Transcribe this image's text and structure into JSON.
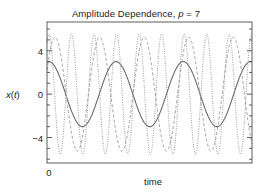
{
  "chart_data": {
    "type": "line",
    "title_parts": {
      "prefix": "Amplitude Dependence, ",
      "param_symbol": "p",
      "param_rest": " = 7"
    },
    "title": "Amplitude Dependence, p = 7",
    "xlabel": "time",
    "ylabel": "x(t)",
    "ylabel_parts": {
      "fn": "x",
      "open": "(",
      "var": "t",
      "close": ")"
    },
    "ylim": [
      -6.35,
      6.65
    ],
    "xlim": [
      0,
      18.5
    ],
    "yticks": [
      4,
      0,
      -4
    ],
    "ytick_labels": [
      "4",
      "0",
      "−4"
    ],
    "yticks_minor": [
      5,
      3,
      2,
      1,
      -1,
      -2,
      -3,
      -5,
      6,
      -6
    ],
    "xticks": [
      0
    ],
    "xtick_labels": [
      "0"
    ],
    "grid": false,
    "legend": "none",
    "frame": true,
    "tick_direction": "in",
    "colors": {
      "axis": "#4d4d4d",
      "text": "#1a1a1a",
      "curve_solid": "#6b6b6b",
      "curve_dotted": "#8f8f8f",
      "curve_dashed": "#a0a0a0",
      "background": "#ffffff"
    },
    "series": [
      {
        "name": "slow large-period response",
        "style": "solid",
        "amplitude": 3.0,
        "cycles": 3.05,
        "phase_deg": 80,
        "color": "#6b6b6b"
      },
      {
        "name": "intermediate-period response",
        "style": "dashed",
        "amplitude": 5.25,
        "cycles": 4.6,
        "phase_deg": 25,
        "color": "#a0a0a0"
      },
      {
        "name": "fast high-frequency response",
        "style": "dotted",
        "amplitude": 5.55,
        "cycles": 9.1,
        "phase_deg": 58,
        "color": "#8f8f8f"
      }
    ]
  }
}
